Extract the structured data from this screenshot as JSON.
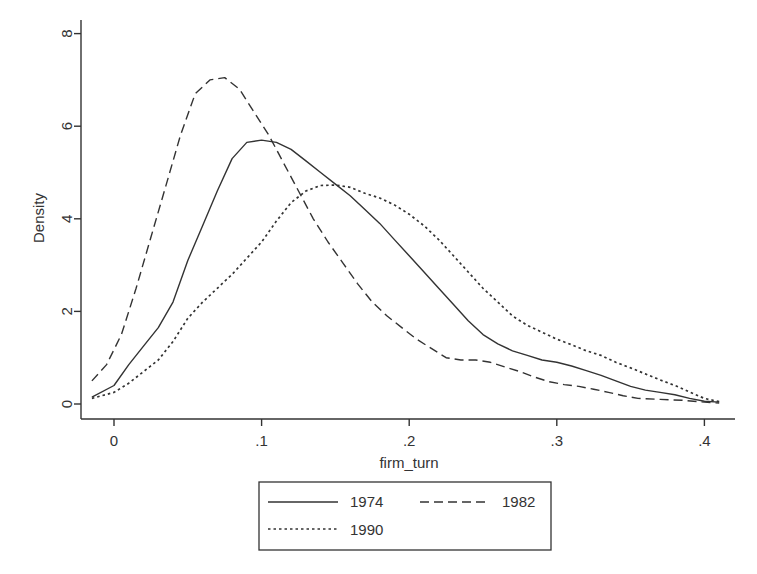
{
  "chart_data": {
    "type": "line",
    "title": "",
    "xlabel": "firm_turn",
    "ylabel": "Density",
    "xlim": [
      -0.025,
      0.415
    ],
    "ylim": [
      0,
      8
    ],
    "x_ticks": [
      0,
      0.1,
      0.2,
      0.3,
      0.4
    ],
    "x_tick_labels": [
      "0",
      ".1",
      ".2",
      ".3",
      ".4"
    ],
    "y_ticks": [
      0,
      2,
      4,
      6,
      8
    ],
    "y_tick_labels": [
      "0",
      "2",
      "4",
      "6",
      "8"
    ],
    "grid": false,
    "legend_position": "bottom",
    "legend": [
      "1974",
      "1982",
      "1990"
    ],
    "series": [
      {
        "name": "1974",
        "style": "solid",
        "points": [
          [
            -0.015,
            0.15
          ],
          [
            0.0,
            0.4
          ],
          [
            0.01,
            0.85
          ],
          [
            0.02,
            1.25
          ],
          [
            0.03,
            1.65
          ],
          [
            0.04,
            2.2
          ],
          [
            0.05,
            3.1
          ],
          [
            0.06,
            3.85
          ],
          [
            0.07,
            4.6
          ],
          [
            0.08,
            5.3
          ],
          [
            0.09,
            5.65
          ],
          [
            0.1,
            5.7
          ],
          [
            0.11,
            5.65
          ],
          [
            0.12,
            5.5
          ],
          [
            0.13,
            5.25
          ],
          [
            0.14,
            5.0
          ],
          [
            0.15,
            4.75
          ],
          [
            0.16,
            4.5
          ],
          [
            0.17,
            4.2
          ],
          [
            0.18,
            3.9
          ],
          [
            0.19,
            3.55
          ],
          [
            0.2,
            3.2
          ],
          [
            0.21,
            2.85
          ],
          [
            0.22,
            2.5
          ],
          [
            0.23,
            2.15
          ],
          [
            0.24,
            1.8
          ],
          [
            0.25,
            1.5
          ],
          [
            0.26,
            1.3
          ],
          [
            0.27,
            1.15
          ],
          [
            0.28,
            1.05
          ],
          [
            0.29,
            0.95
          ],
          [
            0.3,
            0.9
          ],
          [
            0.31,
            0.82
          ],
          [
            0.32,
            0.72
          ],
          [
            0.33,
            0.62
          ],
          [
            0.34,
            0.5
          ],
          [
            0.35,
            0.38
          ],
          [
            0.36,
            0.3
          ],
          [
            0.37,
            0.25
          ],
          [
            0.38,
            0.2
          ],
          [
            0.39,
            0.12
          ],
          [
            0.4,
            0.06
          ],
          [
            0.41,
            0.04
          ]
        ]
      },
      {
        "name": "1982",
        "style": "dashed",
        "points": [
          [
            -0.015,
            0.5
          ],
          [
            -0.005,
            0.85
          ],
          [
            0.005,
            1.5
          ],
          [
            0.015,
            2.5
          ],
          [
            0.025,
            3.6
          ],
          [
            0.035,
            4.7
          ],
          [
            0.045,
            5.8
          ],
          [
            0.055,
            6.7
          ],
          [
            0.065,
            7.0
          ],
          [
            0.075,
            7.05
          ],
          [
            0.085,
            6.8
          ],
          [
            0.095,
            6.3
          ],
          [
            0.105,
            5.8
          ],
          [
            0.115,
            5.2
          ],
          [
            0.125,
            4.6
          ],
          [
            0.135,
            4.0
          ],
          [
            0.145,
            3.5
          ],
          [
            0.155,
            3.05
          ],
          [
            0.165,
            2.6
          ],
          [
            0.175,
            2.2
          ],
          [
            0.185,
            1.9
          ],
          [
            0.195,
            1.65
          ],
          [
            0.205,
            1.4
          ],
          [
            0.215,
            1.2
          ],
          [
            0.225,
            1.0
          ],
          [
            0.235,
            0.95
          ],
          [
            0.245,
            0.95
          ],
          [
            0.255,
            0.9
          ],
          [
            0.265,
            0.8
          ],
          [
            0.275,
            0.7
          ],
          [
            0.285,
            0.58
          ],
          [
            0.295,
            0.48
          ],
          [
            0.305,
            0.42
          ],
          [
            0.315,
            0.38
          ],
          [
            0.325,
            0.32
          ],
          [
            0.335,
            0.25
          ],
          [
            0.345,
            0.18
          ],
          [
            0.355,
            0.12
          ],
          [
            0.37,
            0.1
          ],
          [
            0.385,
            0.08
          ],
          [
            0.4,
            0.04
          ],
          [
            0.41,
            0.02
          ]
        ]
      },
      {
        "name": "1990",
        "style": "dotted",
        "points": [
          [
            -0.015,
            0.12
          ],
          [
            0.0,
            0.25
          ],
          [
            0.01,
            0.45
          ],
          [
            0.02,
            0.7
          ],
          [
            0.03,
            0.95
          ],
          [
            0.04,
            1.35
          ],
          [
            0.05,
            1.85
          ],
          [
            0.06,
            2.2
          ],
          [
            0.07,
            2.5
          ],
          [
            0.08,
            2.8
          ],
          [
            0.09,
            3.15
          ],
          [
            0.1,
            3.5
          ],
          [
            0.11,
            3.95
          ],
          [
            0.12,
            4.35
          ],
          [
            0.13,
            4.6
          ],
          [
            0.14,
            4.72
          ],
          [
            0.15,
            4.73
          ],
          [
            0.16,
            4.68
          ],
          [
            0.17,
            4.55
          ],
          [
            0.18,
            4.45
          ],
          [
            0.19,
            4.3
          ],
          [
            0.2,
            4.1
          ],
          [
            0.21,
            3.85
          ],
          [
            0.22,
            3.55
          ],
          [
            0.23,
            3.2
          ],
          [
            0.24,
            2.85
          ],
          [
            0.25,
            2.5
          ],
          [
            0.26,
            2.2
          ],
          [
            0.27,
            1.9
          ],
          [
            0.28,
            1.7
          ],
          [
            0.29,
            1.55
          ],
          [
            0.3,
            1.4
          ],
          [
            0.31,
            1.28
          ],
          [
            0.32,
            1.15
          ],
          [
            0.33,
            1.05
          ],
          [
            0.34,
            0.9
          ],
          [
            0.35,
            0.78
          ],
          [
            0.36,
            0.65
          ],
          [
            0.37,
            0.52
          ],
          [
            0.38,
            0.4
          ],
          [
            0.39,
            0.26
          ],
          [
            0.4,
            0.12
          ],
          [
            0.41,
            0.05
          ]
        ]
      }
    ]
  }
}
